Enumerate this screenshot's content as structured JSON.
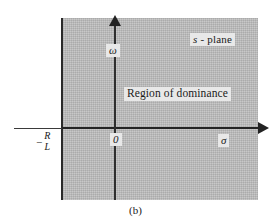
{
  "figure": {
    "caption": "(b)",
    "plane_label": {
      "symbol": "s",
      "suffix": " - plane",
      "full": "s - plane"
    },
    "region_label": "Region of dominance",
    "axes": {
      "vertical_label": "ω",
      "horizontal_label": "σ",
      "origin_label": "0"
    },
    "boundary": {
      "minus_sign": "−",
      "numerator": "R",
      "denominator": "L",
      "full": "−R/L"
    },
    "colors": {
      "shade": "#b9b9b9",
      "axis": "#232323",
      "background": "#ffffff",
      "label_box": "#e8e8e8"
    }
  }
}
